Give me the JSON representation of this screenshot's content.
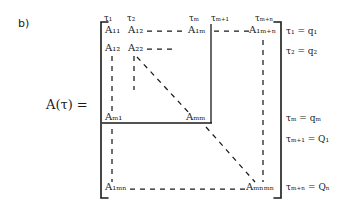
{
  "figure": {
    "panel_label": "b)",
    "matrix_name": "ᴸA(τ) =",
    "matrix_name_plain": "A(τ) ="
  },
  "column_ticks": [
    {
      "id": "tick-1",
      "text": "τ₁",
      "x": 104,
      "y": 14
    },
    {
      "id": "tick-2",
      "text": "τ₂",
      "x": 127,
      "y": 14
    },
    {
      "id": "tick-m",
      "text": "τₘ",
      "x": 190,
      "y": 14
    },
    {
      "id": "tick-m-plus-1",
      "text": "τₘ₊₁",
      "x": 211,
      "y": 14
    },
    {
      "id": "tick-m-plus-n",
      "text": "τₘ₊ₙ",
      "x": 256,
      "y": 14
    }
  ],
  "entries": [
    {
      "id": "entry-11",
      "text": "A₁₁",
      "x": 105,
      "y": 30
    },
    {
      "id": "entry-12",
      "text": "A₁₂",
      "x": 128,
      "y": 30
    },
    {
      "id": "entry-1m",
      "text": "A₁ₘ",
      "x": 190,
      "y": 30
    },
    {
      "id": "entry-1mn",
      "text": "A₁ₘ₊ₙ",
      "x": 253,
      "y": 30
    },
    {
      "id": "entry-21",
      "text": "A₁₂",
      "x": 105,
      "y": 48
    },
    {
      "id": "entry-22",
      "text": "A₂₂",
      "x": 128,
      "y": 48
    },
    {
      "id": "entry-m1",
      "text": "Aₘ₁",
      "x": 105,
      "y": 118
    },
    {
      "id": "entry-mm",
      "text": "Aₘₘ",
      "x": 189,
      "y": 118
    },
    {
      "id": "entry-mn1",
      "text": "A₁ₘₙ",
      "x": 105,
      "y": 188
    },
    {
      "id": "entry-mnmn",
      "text": "Aₘₙₘₙ",
      "x": 251,
      "y": 188
    }
  ],
  "identifications": [
    {
      "id": "eq-tau1",
      "text": "τ₁ = q₁",
      "x": 286,
      "y": 32
    },
    {
      "id": "eq-tau2",
      "text": "τ₂ = q₂",
      "x": 286,
      "y": 52
    },
    {
      "id": "eq-taum",
      "text": "τₘ = qₘ",
      "x": 286,
      "y": 119
    },
    {
      "id": "eq-taum1",
      "text": "τₘ₊₁ = Q₁",
      "x": 286,
      "y": 140
    },
    {
      "id": "eq-taumn",
      "text": "τₘ₊ₙ = Qₙ",
      "x": 286,
      "y": 187
    }
  ],
  "colors": {
    "ink": "#1a1a1a",
    "paper": "#ffffff"
  },
  "geometry": {
    "bracket_left_x": 101,
    "bracket_right_x": 281,
    "bracket_top_y": 22,
    "bracket_bottom_y": 198,
    "block_divider_x": 211,
    "block_divider_y": 123
  }
}
